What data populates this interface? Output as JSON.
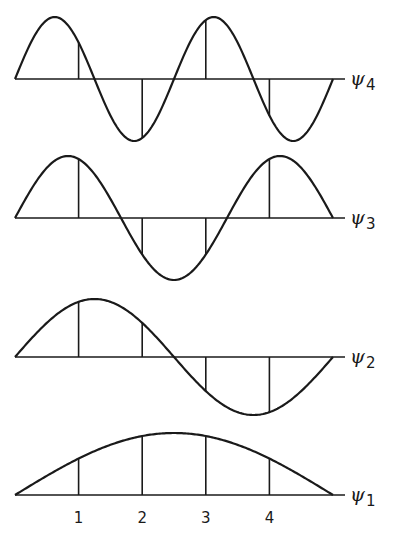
{
  "figure": {
    "x_start": 15,
    "x_end": 333,
    "site_positions": [
      1,
      2,
      3,
      4
    ],
    "tick_labels": [
      "1",
      "2",
      "3",
      "4"
    ],
    "stroke_color": "#1a1a1a",
    "background": "#ffffff"
  },
  "chart_data": {
    "type": "line",
    "title": "",
    "xlabel": "",
    "ylabel": "",
    "x_ticks": [
      "1",
      "2",
      "3",
      "4"
    ],
    "grid": false,
    "legend": "inline labels at right of each baseline",
    "series": [
      {
        "name": "ψ4",
        "label_main": "ψ",
        "label_sub": "4",
        "n": 4,
        "baseline_y": 79,
        "amplitude": 62,
        "site_values": [
          0.588,
          -0.951,
          0.951,
          -0.588
        ]
      },
      {
        "name": "ψ3",
        "label_main": "ψ",
        "label_sub": "3",
        "n": 3,
        "baseline_y": 218,
        "amplitude": 62,
        "site_values": [
          0.951,
          -0.588,
          -0.588,
          0.951
        ]
      },
      {
        "name": "ψ2",
        "label_main": "ψ",
        "label_sub": "2",
        "n": 2,
        "baseline_y": 357,
        "amplitude": 58,
        "site_values": [
          0.951,
          0.588,
          -0.588,
          -0.951
        ]
      },
      {
        "name": "ψ1",
        "label_main": "ψ",
        "label_sub": "1",
        "n": 1,
        "baseline_y": 495,
        "amplitude": 62,
        "site_values": [
          0.588,
          0.951,
          0.951,
          0.588
        ]
      }
    ]
  }
}
